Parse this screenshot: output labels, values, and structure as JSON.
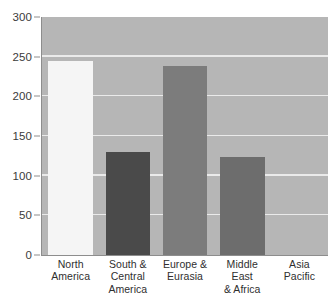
{
  "chart_data": {
    "type": "bar",
    "title": "",
    "subtitle": "",
    "xlabel": "",
    "ylabel": "",
    "categories": [
      "North America",
      "South & Central America",
      "Europe & Eurasia",
      "Middle East & Africa",
      "Asia Pacific"
    ],
    "values": [
      245,
      130,
      238,
      124,
      0
    ],
    "ylim": [
      0,
      300
    ],
    "ytick_labels": [
      "0",
      "50",
      "100",
      "150",
      "200",
      "250",
      "300"
    ],
    "ytick_values": [
      0,
      50,
      100,
      150,
      200,
      250,
      300
    ],
    "grid": true,
    "grid_axis": "y",
    "legend": "none",
    "bar_colors": [
      "#f5f5f5",
      "#4a4a4a",
      "#7c7c7c",
      "#6d6d6d",
      "#b6b6b6"
    ],
    "plot_background": "#b6b6b6",
    "gridline_color": "#eaeaea",
    "axis_color": "#8d8d8d",
    "text_color": "#2f2f2f",
    "annotations": []
  },
  "axis": {
    "y_ticks": [
      {
        "label": "300",
        "value": 300
      },
      {
        "label": "250",
        "value": 250
      },
      {
        "label": "200",
        "value": 200
      },
      {
        "label": "150",
        "value": 150
      },
      {
        "label": "100",
        "value": 100
      },
      {
        "label": "50",
        "value": 50
      },
      {
        "label": "0",
        "value": 0
      }
    ]
  },
  "x_labels": [
    {
      "line1": "North",
      "line2": "America",
      "line3": ""
    },
    {
      "line1": "South &",
      "line2": "Central",
      "line3": "America"
    },
    {
      "line1": "Europe &",
      "line2": "Eurasia",
      "line3": ""
    },
    {
      "line1": "Middle East",
      "line2": "& Africa",
      "line3": ""
    },
    {
      "line1": "Asia",
      "line2": "Pacific",
      "line3": ""
    }
  ]
}
